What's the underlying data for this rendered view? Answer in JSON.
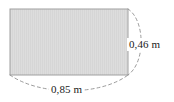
{
  "figure": {
    "shape": "rectangle",
    "fill_color": "#dcdcdc",
    "stroke_color": "#9a9a9a",
    "dimension_line_color": "#8c8c8c",
    "text_color": "#1a1a1a",
    "background_color": "#ffffff",
    "unit": "m",
    "decimal_separator": ",",
    "dimensions": {
      "height": {
        "value": "0,46",
        "unit": "m",
        "label": "0,46 m",
        "position": "right"
      },
      "width": {
        "value": "0,85",
        "unit": "m",
        "label": "0,85 m",
        "position": "bottom"
      }
    },
    "geometry": {
      "rect_x": 10,
      "rect_y": 9,
      "rect_width": 118,
      "rect_height": 66,
      "arc_right_d": "M 128 9 C 145 20 146 62 128 75",
      "arc_bottom_d": "M 10 75 C 40 96 100 96 128 75"
    }
  }
}
